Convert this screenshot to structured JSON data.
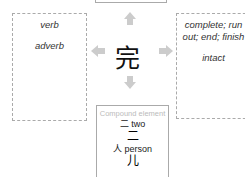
{
  "center": {
    "character": "完"
  },
  "left_box": {
    "items": [
      "verb",
      "adverb"
    ]
  },
  "right_box": {
    "items": [
      "complete; run out; end; finish",
      "intact"
    ]
  },
  "bottom_box": {
    "title": "Compound element",
    "elements": [
      {
        "glyph": "二",
        "label": "two",
        "form": "二"
      },
      {
        "glyph": "人",
        "label": "person",
        "form": "儿"
      }
    ]
  }
}
